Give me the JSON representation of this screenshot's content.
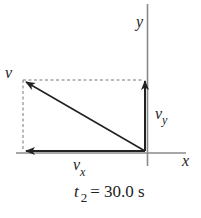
{
  "diagram": {
    "type": "velocity-vector-components",
    "axes": {
      "x_label": "x",
      "y_label": "y"
    },
    "vectors": {
      "resultant_label": "v",
      "x_component_label": "v",
      "x_component_subscript": "x",
      "y_component_label": "v",
      "y_component_subscript": "y"
    },
    "caption": {
      "variable": "t",
      "subscript": "2",
      "equals": "= 30.0 s"
    },
    "colors": {
      "axis": "#8a8a8a",
      "vector": "#222222",
      "dashed": "#777777",
      "background": "#ffffff"
    }
  }
}
